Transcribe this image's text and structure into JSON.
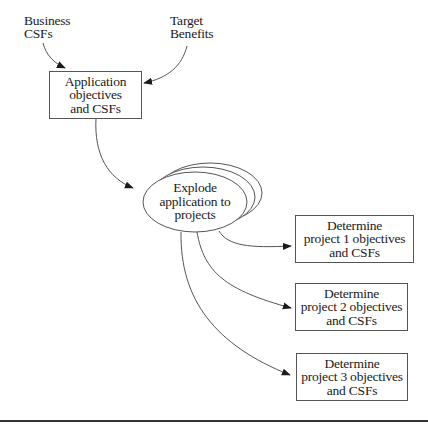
{
  "diagram": {
    "inputs": {
      "business_csfs": [
        "Business",
        "CSFs"
      ],
      "target_benefits": [
        "Target",
        "Benefits"
      ]
    },
    "application_box": [
      "Application",
      "objectives",
      "and CSFs"
    ],
    "explode_ellipse": [
      "Explode",
      "application to",
      "projects"
    ],
    "project_boxes": [
      [
        "Determine",
        "project 1 objectives",
        "and CSFs"
      ],
      [
        "Determine",
        "project 2 objectives",
        "and CSFs"
      ],
      [
        "Determine",
        "project 3 objectives",
        "and CSFs"
      ]
    ],
    "edges": [
      {
        "from": "Business CSFs",
        "to": "Application objectives and CSFs"
      },
      {
        "from": "Target Benefits",
        "to": "Application objectives and CSFs"
      },
      {
        "from": "Application objectives and CSFs",
        "to": "Explode application to projects"
      },
      {
        "from": "Explode application to projects",
        "to": "Determine project 1 objectives and CSFs"
      },
      {
        "from": "Explode application to projects",
        "to": "Determine project 2 objectives and CSFs"
      },
      {
        "from": "Explode application to projects",
        "to": "Determine project 3 objectives and CSFs"
      }
    ],
    "colors": {
      "line": "#555555",
      "text": "#1a1a1a",
      "background": "#ffffff"
    }
  }
}
